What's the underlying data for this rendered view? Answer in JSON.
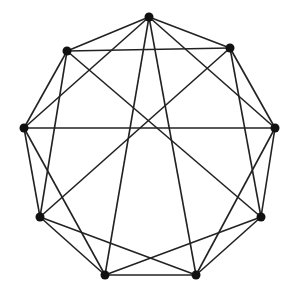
{
  "diagram": {
    "type": "graph",
    "style": {
      "edge_color": "#222222",
      "vertex_color": "#111111",
      "background": "#ffffff",
      "vertex_radius": 4.5,
      "edge_width": 1.6
    },
    "vertices": [
      {
        "id": 0,
        "x": 149,
        "y": 17
      },
      {
        "id": 1,
        "x": 230,
        "y": 48
      },
      {
        "id": 2,
        "x": 275,
        "y": 128
      },
      {
        "id": 3,
        "x": 261,
        "y": 217
      },
      {
        "id": 4,
        "x": 196,
        "y": 275
      },
      {
        "id": 5,
        "x": 105,
        "y": 275
      },
      {
        "id": 6,
        "x": 40,
        "y": 217
      },
      {
        "id": 7,
        "x": 24,
        "y": 128
      },
      {
        "id": 8,
        "x": 67,
        "y": 51
      }
    ],
    "edges": [
      [
        0,
        1
      ],
      [
        1,
        2
      ],
      [
        2,
        3
      ],
      [
        3,
        4
      ],
      [
        4,
        5
      ],
      [
        5,
        6
      ],
      [
        6,
        7
      ],
      [
        7,
        8
      ],
      [
        8,
        0
      ],
      [
        0,
        2
      ],
      [
        0,
        4
      ],
      [
        0,
        5
      ],
      [
        0,
        7
      ],
      [
        1,
        8
      ],
      [
        1,
        3
      ],
      [
        1,
        6
      ],
      [
        2,
        7
      ],
      [
        2,
        4
      ],
      [
        3,
        5
      ],
      [
        3,
        8
      ],
      [
        4,
        6
      ],
      [
        5,
        7
      ],
      [
        6,
        8
      ]
    ]
  }
}
